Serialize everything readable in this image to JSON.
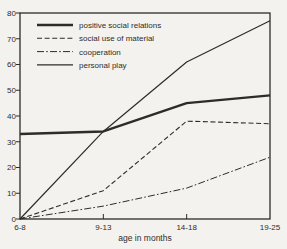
{
  "figure": {
    "background": "#f4f2ee",
    "ink_color": "#2e2c29",
    "xlabel": "age in months"
  },
  "chart_data": {
    "type": "line",
    "categories": [
      "6-8",
      "9-13",
      "14-18",
      "19-25"
    ],
    "xlabel": "age in months",
    "ylabel": "",
    "ylim": [
      0,
      80
    ],
    "ytick_step": 10,
    "yticks": [
      0,
      10,
      20,
      30,
      40,
      50,
      60,
      70,
      80
    ],
    "grid": false,
    "legend_position": "top-left-inside",
    "series": [
      {
        "name": "positive social relations",
        "values": [
          33,
          34,
          45,
          48
        ],
        "line_style": "solid-thick"
      },
      {
        "name": "social use of material",
        "values": [
          0,
          11,
          38,
          37
        ],
        "line_style": "dashed"
      },
      {
        "name": "cooperation",
        "values": [
          0,
          5,
          12,
          24
        ],
        "line_style": "dash-dot"
      },
      {
        "name": "personal play",
        "values": [
          0,
          34,
          61,
          77
        ],
        "line_style": "solid-thin"
      }
    ]
  }
}
